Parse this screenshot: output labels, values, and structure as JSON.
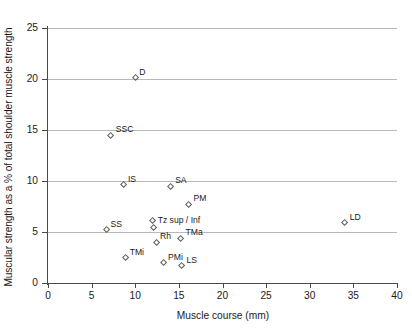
{
  "chart_data": {
    "type": "scatter",
    "title": "",
    "xlabel": "Muscle course (mm)",
    "ylabel": "Muscular strength as a % of total shoulder muscle strength",
    "xlim": [
      0,
      40
    ],
    "ylim": [
      0,
      25
    ],
    "xticks": [
      "0",
      "5",
      "10",
      "15",
      "20",
      "25",
      "30",
      "35",
      "40"
    ],
    "yticks": [
      "0",
      "5",
      "10",
      "15",
      "20",
      "25"
    ],
    "grid": "horizontal",
    "legend": "none",
    "points": [
      {
        "label": "D",
        "x": 10.0,
        "y": 20.1,
        "label_dx": 4,
        "label_dy": -10
      },
      {
        "label": "SSC",
        "x": 7.2,
        "y": 14.5,
        "label_dx": 5,
        "label_dy": -10
      },
      {
        "label": "IS",
        "x": 8.7,
        "y": 9.65,
        "label_dx": 4,
        "label_dy": -10
      },
      {
        "label": "SA",
        "x": 14.0,
        "y": 9.5,
        "label_dx": 5,
        "label_dy": -10
      },
      {
        "label": "PM",
        "x": 16.1,
        "y": 7.7,
        "label_dx": 5,
        "label_dy": -10
      },
      {
        "label": "LD",
        "x": 34.0,
        "y": 5.9,
        "label_dx": 5,
        "label_dy": -10
      },
      {
        "label": "Tz sup / Inf",
        "x": 12.0,
        "y": 6.1,
        "label_dx": 5,
        "label_dy": -5
      },
      {
        "label": "",
        "x": 12.1,
        "y": 5.45,
        "label_dx": 0,
        "label_dy": 0
      },
      {
        "label": "SS",
        "x": 6.7,
        "y": 5.2,
        "label_dx": 4,
        "label_dy": -10
      },
      {
        "label": "TMa",
        "x": 15.2,
        "y": 4.4,
        "label_dx": 5,
        "label_dy": -10
      },
      {
        "label": "Rh",
        "x": 12.5,
        "y": 4.0,
        "label_dx": 3,
        "label_dy": -10
      },
      {
        "label": "TMi",
        "x": 8.9,
        "y": 2.5,
        "label_dx": 4,
        "label_dy": -10
      },
      {
        "label": "PMi",
        "x": 13.3,
        "y": 2.0,
        "label_dx": 4,
        "label_dy": -10
      },
      {
        "label": "LS",
        "x": 15.3,
        "y": 1.7,
        "label_dx": 5,
        "label_dy": -10
      }
    ]
  },
  "colors": {
    "axis": "#4a4a4a",
    "grid": "#b9b9b9",
    "marker_stroke": "#5a5a5a",
    "text": "#1a1a1a",
    "background": "#ffffff"
  }
}
